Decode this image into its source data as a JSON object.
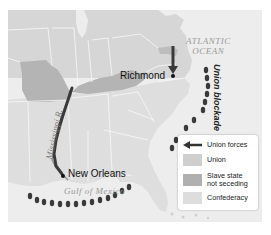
{
  "map": {
    "title": "Union Anaconda Plan map",
    "labels": {
      "atlantic_line1": "ATLANTIC",
      "atlantic_line2": "OCEAN",
      "gulf": "Gulf of Mexico",
      "river": "Mississippi R.",
      "blockade": "Union blockade"
    },
    "cities": [
      {
        "name": "Richmond"
      },
      {
        "name": "New Orleans"
      }
    ],
    "colors": {
      "union": "#d8d8d8",
      "slave_state_not_seceding": "#b4b4b4",
      "confederacy": "#e2e2e2",
      "water": "#ececec",
      "arrow": "#3a3a3a",
      "borders": "#f6f6f6"
    }
  },
  "legend": {
    "items": [
      {
        "label": "Union forces",
        "icon": "arrow-left-icon"
      },
      {
        "label": "Union",
        "color": "#cfcfcf"
      },
      {
        "label_line1": "Slave state",
        "label_line2": "not seceding",
        "color": "#b0b0b0"
      },
      {
        "label": "Confederacy",
        "color": "#dddddd"
      }
    ]
  }
}
